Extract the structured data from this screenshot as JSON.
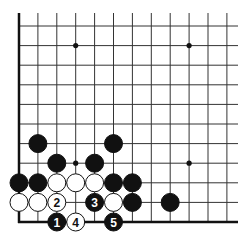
{
  "board": {
    "title": "Go corner diagram (lower-left)",
    "columns": 12,
    "rows": 11,
    "origin_x": 19,
    "origin_y": 26,
    "col_spacing": 18.9,
    "row_spacing": 19.6,
    "line_color": "#333333",
    "edge_color": "#111111",
    "hoshi": [
      [
        3,
        1
      ],
      [
        9,
        1
      ],
      [
        3,
        7
      ],
      [
        9,
        7
      ]
    ],
    "stones": [
      {
        "col": 1,
        "row": 6,
        "color": "black"
      },
      {
        "col": 5,
        "row": 6,
        "color": "black"
      },
      {
        "col": 2,
        "row": 7,
        "color": "black"
      },
      {
        "col": 4,
        "row": 7,
        "color": "black"
      },
      {
        "col": 0,
        "row": 8,
        "color": "black"
      },
      {
        "col": 1,
        "row": 8,
        "color": "black"
      },
      {
        "col": 2,
        "row": 8,
        "color": "white"
      },
      {
        "col": 3,
        "row": 8,
        "color": "white"
      },
      {
        "col": 4,
        "row": 8,
        "color": "white"
      },
      {
        "col": 5,
        "row": 8,
        "color": "black"
      },
      {
        "col": 6,
        "row": 8,
        "color": "black"
      },
      {
        "col": 0,
        "row": 9,
        "color": "white"
      },
      {
        "col": 1,
        "row": 9,
        "color": "white"
      },
      {
        "col": 2,
        "row": 9,
        "color": "white",
        "label": "2"
      },
      {
        "col": 4,
        "row": 9,
        "color": "black",
        "label": "3"
      },
      {
        "col": 5,
        "row": 9,
        "color": "white"
      },
      {
        "col": 6,
        "row": 9,
        "color": "black"
      },
      {
        "col": 8,
        "row": 9,
        "color": "black"
      },
      {
        "col": 2,
        "row": 10,
        "color": "black",
        "label": "1"
      },
      {
        "col": 3,
        "row": 10,
        "color": "white",
        "label": "4"
      },
      {
        "col": 5,
        "row": 10,
        "color": "black",
        "label": "5"
      }
    ]
  }
}
